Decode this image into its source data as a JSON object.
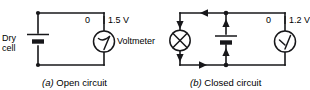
{
  "figure": {
    "background_color": "#ffffff",
    "ink_color": "#17171a",
    "width": 310,
    "height": 90
  },
  "circuit_a": {
    "caption_index": "(a)",
    "caption_text": "Open circuit",
    "source_label_line1": "Dry",
    "source_label_line2": "cell",
    "source_type": "battery-cell",
    "meter": {
      "type": "voltmeter",
      "name_label": "Voltmeter",
      "scale_min_label": "0",
      "scale_max_label": "1.5 V",
      "reading_value": 1.5,
      "reading_units": "V",
      "needle_position": "full-scale-right"
    },
    "current_flowing": false
  },
  "circuit_b": {
    "caption_index": "(b)",
    "caption_text": "Closed circuit",
    "source_type": "battery-cell",
    "load": {
      "type": "lamp",
      "symbol": "circle-with-x"
    },
    "meter": {
      "type": "voltmeter",
      "scale_min_label": "0",
      "scale_max_label": "1.2 V",
      "reading_value": 1.2,
      "reading_units": "V",
      "needle_position": "near-full-scale-right"
    },
    "current_flowing": true,
    "current_arrows": [
      "top-wire-leftward",
      "lamp-branch-downward-upper",
      "lamp-branch-downward-lower",
      "battery-branch-upward-lower",
      "battery-branch-upward-upper",
      "bottom-wire-rightward"
    ]
  }
}
